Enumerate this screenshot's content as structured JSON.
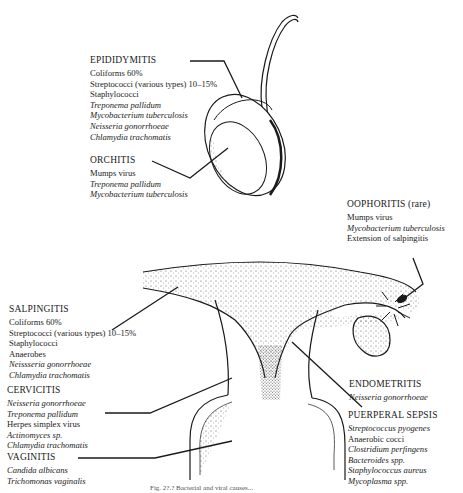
{
  "figure": {
    "caption_fragment": "Fig. 2?.?  Bacterial and viral causes..."
  },
  "labels": {
    "epididymitis": {
      "title": "EPIDIDYMITIS",
      "items": [
        {
          "text": "Coliforms 60%",
          "italic": false
        },
        {
          "text": "Streptococci (various types) 10–15%",
          "italic": false
        },
        {
          "text": "Staphylococci",
          "italic": false
        },
        {
          "text": "Treponema pallidum",
          "italic": true
        },
        {
          "text": "Mycobacterium tuberculosis",
          "italic": true
        },
        {
          "text": "Neisseria gonorrhoeae",
          "italic": true
        },
        {
          "text": "Chlamydia trachomatis",
          "italic": true
        }
      ]
    },
    "orchitis": {
      "title": "ORCHITIS",
      "items": [
        {
          "text": "Mumps virus",
          "italic": false
        },
        {
          "text": "Treponema pallidum",
          "italic": true
        },
        {
          "text": "Mycobacterium tuberculosis",
          "italic": true
        }
      ]
    },
    "oophoritis": {
      "title": "OOPHORITIS (rare)",
      "items": [
        {
          "text": "Mumps virus",
          "italic": false
        },
        {
          "text": "Mycobacterium tuberculosis",
          "italic": true
        },
        {
          "text": "Extension of salpingitis",
          "italic": false
        }
      ]
    },
    "salpingitis": {
      "title": "SALPINGITIS",
      "items": [
        {
          "text": "Coliforms 60%",
          "italic": false
        },
        {
          "text": "Streptococci (various types) 10–15%",
          "italic": false
        },
        {
          "text": "Staphylococci",
          "italic": false
        },
        {
          "text": "Anaerobes",
          "italic": false
        },
        {
          "text": "Neissseria gonorrhoeae",
          "italic": true
        },
        {
          "text": "Chlamydia trachomatis",
          "italic": true
        }
      ]
    },
    "cervicitis": {
      "title": "CERVICITIS",
      "items": [
        {
          "text": "Neisseria gonorrhoeae",
          "italic": true
        },
        {
          "text": "Treponema pallidum",
          "italic": true
        },
        {
          "text": "Herpes simplex virus",
          "italic": false
        },
        {
          "text": "Actinomyces sp.",
          "italic": true
        },
        {
          "text": "Chlamydia trachomatis",
          "italic": true
        }
      ]
    },
    "vaginitis": {
      "title": "VAGINITIS",
      "items": [
        {
          "text": "Candida albicans",
          "italic": true
        },
        {
          "text": "Trichomonas vaginalis",
          "italic": true
        }
      ]
    },
    "endometritis": {
      "title": "ENDOMETRITIS",
      "items": [
        {
          "text": "Neisseria gonorrhoeae",
          "italic": true
        }
      ]
    },
    "puerperal_sepsis": {
      "title": "PUERPERAL SEPSIS",
      "items": [
        {
          "text": "Streptococcus pyogenes",
          "italic": true
        },
        {
          "text": "Anaerobic cocci",
          "italic": false
        },
        {
          "text": "Clostridium perfingens",
          "italic": true
        },
        {
          "text": "Bacteroides spp.",
          "italic": true
        },
        {
          "text": "Staphylococcus aureus",
          "italic": true
        },
        {
          "text": "Mycoplasma spp.",
          "italic": true
        }
      ]
    }
  },
  "colors": {
    "ink": "#1a1a1a",
    "stipple": "#555555",
    "background": "#ffffff"
  }
}
